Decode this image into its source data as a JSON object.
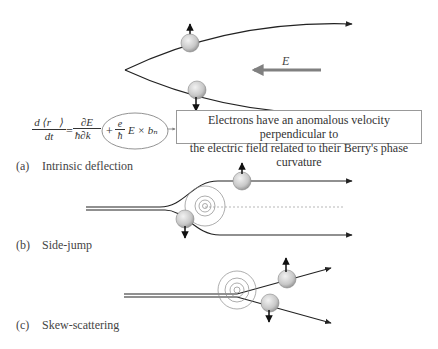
{
  "figure": {
    "panels": [
      {
        "id": "a",
        "tag": "(a)",
        "title": "Intrinsic deflection"
      },
      {
        "id": "b",
        "tag": "(b)",
        "title": "Side-jump"
      },
      {
        "id": "c",
        "tag": "(c)",
        "title": "Skew-scattering"
      }
    ],
    "field_label": "E",
    "callout": {
      "line1": "Electrons have an anomalous velocity perpendicular to",
      "line2": "the electric field related to their Berry's phase curvature"
    },
    "equation": {
      "lhs_num": "d ⟨r⃗⟩",
      "lhs_den": "dt",
      "equals": "=",
      "t1_num": "∂E",
      "t1_den": "ħ∂k⃗",
      "plus": "+",
      "t2_num": "e",
      "t2_den": "ħ",
      "t2_rest": "E × bₙ"
    },
    "colors": {
      "line": "#222222",
      "sphere": "#cfcfcf",
      "field_arrow": "#808080",
      "potential_rings": "#8a8a8a"
    }
  }
}
